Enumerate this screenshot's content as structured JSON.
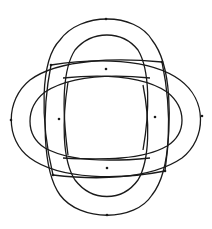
{
  "diagram": {
    "title": "",
    "type": "celtic-knot",
    "stroke_color": "#1a1a1a",
    "background": "#ffffff",
    "lobes": [
      {
        "name": "top",
        "outer": "M53,175 C40,120 40,60 60,40 C80,12 135,12 152,40 C172,65 172,120 165,171",
        "inner": "M68,155 C62,110 62,70 75,50 C92,30 122,30 138,50 C150,70 150,110 143,150"
      },
      {
        "name": "bottom",
        "outer": "M51,65 C42,110 42,170 60,195 C80,222 135,222 152,195 C172,170 172,110 162,62",
        "inner": "M68,82 C62,120 62,160 75,180 C92,202 122,202 138,180 C150,160 150,120 143,85"
      },
      {
        "name": "left",
        "outer": "M162,62 C120,58 60,58 30,80 C5,100 5,140 30,158 C60,180 120,180 165,171",
        "inner": "M150,78 C110,74 70,76 45,92 C25,108 25,135 45,148 C70,162 110,162 150,158"
      },
      {
        "name": "right",
        "outer": "M51,65 C95,58 150,58 180,80 C207,100 207,138 182,158 C150,180 95,180 53,175",
        "inner": "M63,78 C103,74 143,76 167,92 C187,108 187,133 167,146 C143,160 103,160 63,158"
      }
    ],
    "nodes": [
      {
        "x": 106,
        "y": 19
      },
      {
        "x": 107,
        "y": 215
      },
      {
        "x": 11,
        "y": 120
      },
      {
        "x": 202,
        "y": 116
      },
      {
        "x": 106,
        "y": 69
      },
      {
        "x": 59,
        "y": 119
      },
      {
        "x": 155,
        "y": 117
      },
      {
        "x": 107,
        "y": 168
      },
      {
        "x": 51,
        "y": 65
      },
      {
        "x": 162,
        "y": 62
      },
      {
        "x": 53,
        "y": 175
      },
      {
        "x": 165,
        "y": 171
      }
    ]
  }
}
